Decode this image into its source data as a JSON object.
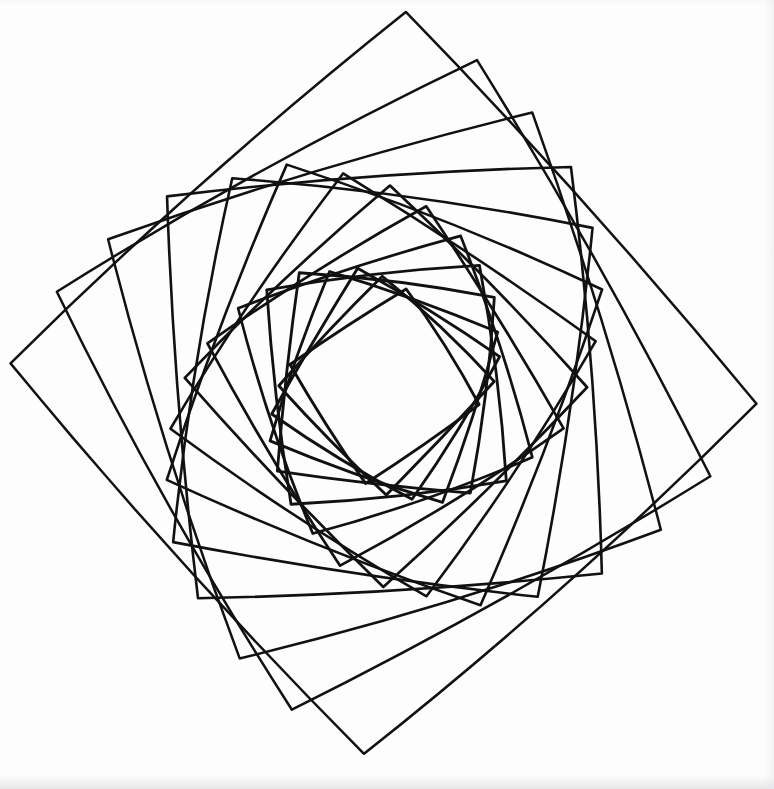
{
  "artwork": {
    "title": "Rotating Squares Spiral",
    "medium": "pen-on-paper line drawing",
    "background_color": "#fdfdfd",
    "ink_color": "#111111",
    "canvas": {
      "width": 774,
      "height": 789
    }
  },
  "chart_data": {
    "type": "line",
    "subtitle": "Nested squares, each rotated and scaled from the previous",
    "xlabel": "",
    "ylabel": "",
    "xlim": [
      0,
      774
    ],
    "ylim": [
      0,
      789
    ],
    "grid": false,
    "legend_position": "none",
    "annotations": [],
    "geometry": {
      "shape": "square",
      "center": {
        "x": 385,
        "y": 385
      },
      "count": 16,
      "first_half_diagonal": 372,
      "scale_step": 0.915,
      "rotation_step_deg": 12.6,
      "start_rotation_deg": 3,
      "side_bow_ratio": 0.052,
      "hand_drawn_jitter": 3.0,
      "stroke_width_outer": 2.5,
      "stroke_width_inner": 2.9,
      "inner_void": {
        "x": 300,
        "y": 290,
        "width": 175,
        "height": 180
      }
    },
    "extent": {
      "left": 18,
      "right": 745,
      "top": 10,
      "bottom": 765
    },
    "series": [
      {
        "name": "square-01",
        "half_diagonal": 372,
        "rotation_deg": 3.0,
        "stroke_width": 2.5
      },
      {
        "name": "square-02",
        "half_diagonal": 340,
        "rotation_deg": 15.6,
        "stroke_width": 2.5
      },
      {
        "name": "square-03",
        "half_diagonal": 311,
        "rotation_deg": 28.2,
        "stroke_width": 2.5
      },
      {
        "name": "square-04",
        "half_diagonal": 285,
        "rotation_deg": 40.8,
        "stroke_width": 2.6
      },
      {
        "name": "square-05",
        "half_diagonal": 261,
        "rotation_deg": 53.4,
        "stroke_width": 2.6
      },
      {
        "name": "square-06",
        "half_diagonal": 239,
        "rotation_deg": 66.0,
        "stroke_width": 2.6
      },
      {
        "name": "square-07",
        "half_diagonal": 218,
        "rotation_deg": 78.6,
        "stroke_width": 2.6
      },
      {
        "name": "square-08",
        "half_diagonal": 200,
        "rotation_deg": 91.2,
        "stroke_width": 2.7
      },
      {
        "name": "square-09",
        "half_diagonal": 183,
        "rotation_deg": 103.8,
        "stroke_width": 2.7
      },
      {
        "name": "square-10",
        "half_diagonal": 167,
        "rotation_deg": 116.4,
        "stroke_width": 2.7
      },
      {
        "name": "square-11",
        "half_diagonal": 153,
        "rotation_deg": 129.0,
        "stroke_width": 2.8
      },
      {
        "name": "square-12",
        "half_diagonal": 140,
        "rotation_deg": 141.6,
        "stroke_width": 2.8
      },
      {
        "name": "square-13",
        "half_diagonal": 128,
        "rotation_deg": 154.2,
        "stroke_width": 2.8
      },
      {
        "name": "square-14",
        "half_diagonal": 117,
        "rotation_deg": 166.8,
        "stroke_width": 2.9
      },
      {
        "name": "square-15",
        "half_diagonal": 107,
        "rotation_deg": 179.4,
        "stroke_width": 2.9
      },
      {
        "name": "square-16",
        "half_diagonal": 98,
        "rotation_deg": 192.0,
        "stroke_width": 2.9
      }
    ]
  }
}
